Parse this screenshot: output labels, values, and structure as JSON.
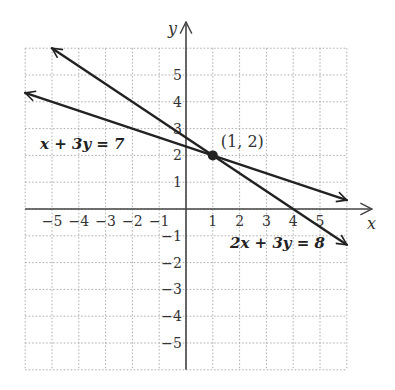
{
  "chart_data": {
    "type": "line",
    "title": "",
    "xlabel": "x",
    "ylabel": "y",
    "xlim": [
      -6,
      6
    ],
    "ylim": [
      -6,
      6
    ],
    "grid": true,
    "xticks": [
      -5,
      -4,
      -3,
      -2,
      -1,
      1,
      2,
      3,
      4,
      5
    ],
    "yticks": [
      -5,
      -4,
      -3,
      -2,
      -1,
      1,
      2,
      3,
      4,
      5
    ],
    "xtick_labels": [
      "−5",
      "−4",
      "−3",
      "−2",
      "−1",
      "1",
      "2",
      "3",
      "4",
      "5"
    ],
    "ytick_labels": [
      "5",
      "4",
      "3",
      "2",
      "1",
      "−1",
      "−2",
      "−3",
      "−4",
      "−5"
    ],
    "series": [
      {
        "name": "x + 3y = 7",
        "label": "x + 3y = 7",
        "x": [
          -6,
          6
        ],
        "y": [
          4.333,
          0.333
        ],
        "color": "#222222"
      },
      {
        "name": "2x + 3y = 8",
        "label": "2x + 3y = 8",
        "x": [
          -5,
          6
        ],
        "y": [
          6,
          -1.333
        ],
        "color": "#222222"
      }
    ],
    "annotations": [
      {
        "type": "point",
        "x": 1,
        "y": 2,
        "label": "(1, 2)"
      }
    ]
  },
  "labels": {
    "x_axis": "x",
    "y_axis": "y",
    "line1": "x + 3y = 7",
    "line2": "2x + 3y = 8",
    "point": "(1, 2)"
  }
}
